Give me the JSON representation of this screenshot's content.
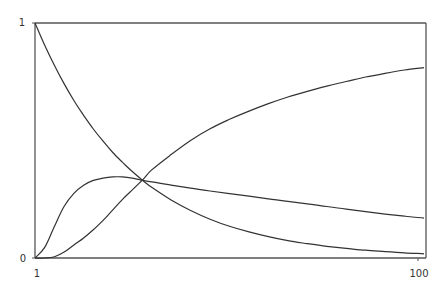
{
  "chart_data": {
    "type": "line",
    "title": "",
    "xlabel": "",
    "ylabel": "",
    "x_tick_labels": [
      "1",
      "100"
    ],
    "y_tick_labels": [
      "0",
      "1"
    ],
    "xlim": [
      1,
      100
    ],
    "ylim": [
      0,
      1
    ],
    "grid": false,
    "legend": null,
    "x_fraction": [
      0,
      0.025,
      0.05,
      0.075,
      0.1,
      0.125,
      0.15,
      0.175,
      0.2,
      0.225,
      0.25,
      0.278,
      0.3,
      0.35,
      0.4,
      0.45,
      0.5,
      0.55,
      0.6,
      0.65,
      0.7,
      0.75,
      0.8,
      0.85,
      0.9,
      0.95,
      1.0
    ],
    "series": [
      {
        "name": "decaying-curve",
        "values": [
          1.0,
          0.905,
          0.819,
          0.741,
          0.67,
          0.607,
          0.549,
          0.497,
          0.449,
          0.407,
          0.368,
          0.329,
          0.301,
          0.247,
          0.202,
          0.165,
          0.135,
          0.111,
          0.091,
          0.074,
          0.061,
          0.05,
          0.041,
          0.033,
          0.027,
          0.022,
          0.018
        ]
      },
      {
        "name": "hump-curve",
        "values": [
          0.0,
          0.045,
          0.135,
          0.22,
          0.275,
          0.31,
          0.33,
          0.34,
          0.345,
          0.345,
          0.34,
          0.33,
          0.324,
          0.31,
          0.297,
          0.285,
          0.274,
          0.263,
          0.252,
          0.241,
          0.23,
          0.219,
          0.208,
          0.197,
          0.187,
          0.178,
          0.17
        ]
      },
      {
        "name": "rising-curve",
        "values": [
          0.0,
          0.0,
          0.005,
          0.025,
          0.055,
          0.085,
          0.12,
          0.16,
          0.205,
          0.25,
          0.29,
          0.335,
          0.375,
          0.44,
          0.5,
          0.55,
          0.59,
          0.625,
          0.657,
          0.685,
          0.709,
          0.731,
          0.751,
          0.77,
          0.786,
          0.8,
          0.81
        ]
      }
    ]
  },
  "style": {
    "axis_color": "#555555",
    "line_color": "#333333"
  }
}
